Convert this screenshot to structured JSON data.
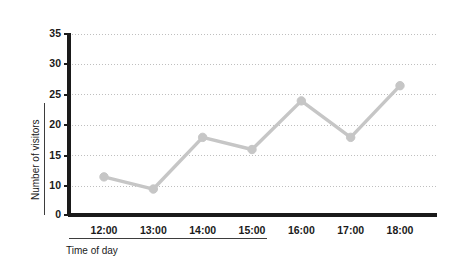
{
  "chart_data": {
    "type": "line",
    "title": "",
    "xlabel": "Time of day",
    "ylabel": "Number of visitors",
    "categories": [
      "12:00",
      "13:00",
      "14:00",
      "15:00",
      "16:00",
      "17:00",
      "18:00"
    ],
    "values": [
      11.5,
      9.5,
      18,
      16,
      24,
      18,
      26.5
    ],
    "series": [
      {
        "name": "Number of visitors",
        "values": [
          11.5,
          9.5,
          18,
          16,
          24,
          18,
          26.5
        ]
      }
    ],
    "ylim": [
      0,
      35
    ],
    "y_ticks": [
      0,
      10,
      15,
      20,
      25,
      30,
      35
    ],
    "y_tick_labels": [
      "0",
      "10",
      "15",
      "20",
      "25",
      "30",
      "35"
    ],
    "x_tick_labels": [
      "12:00",
      "13:00",
      "14:00",
      "15:00",
      "16:00",
      "17:00",
      "18:00"
    ],
    "grid": true,
    "grid_style": "dotted",
    "legend": "none",
    "broken_axis": true,
    "line_color": "#c6c6c6",
    "marker_color": "#c6c6c6",
    "axis_color": "#1a1a1a",
    "grid_color": "#bfbfbf",
    "background_color": "#ffffff"
  }
}
